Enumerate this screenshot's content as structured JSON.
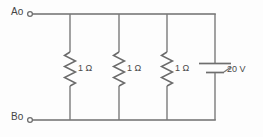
{
  "figure": {
    "kind": "electrical-circuit-schematic",
    "background_color": "#fdfdfd",
    "line_color": "#6e6e6e",
    "text_color": "#4a4a4a"
  },
  "terminals": [
    {
      "id": "a",
      "label": "Ao",
      "letter": "A",
      "position": "top-left"
    },
    {
      "id": "b",
      "label": "Bo",
      "letter": "B",
      "position": "bottom-left"
    }
  ],
  "components": {
    "resistors": [
      {
        "id": "r1",
        "label": "1 Ω",
        "value": 1,
        "unit": "Ω",
        "symbol": "zigzag-resistor"
      },
      {
        "id": "r2",
        "label": "1 Ω",
        "value": 1,
        "unit": "Ω",
        "symbol": "zigzag-resistor"
      },
      {
        "id": "r3",
        "label": "1 Ω",
        "value": 1,
        "unit": "Ω",
        "symbol": "zigzag-resistor"
      }
    ],
    "source": {
      "id": "v1",
      "label": "20 V",
      "value": 20,
      "unit": "V",
      "symbol": "battery-cell"
    }
  }
}
